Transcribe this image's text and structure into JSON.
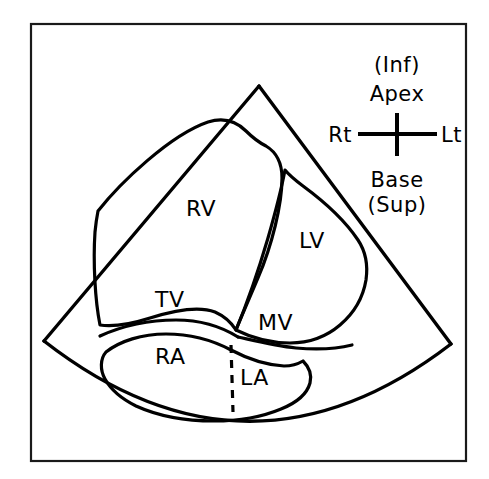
{
  "figure": {
    "background_color": "#ffffff",
    "line_color": "#000000",
    "frame_color": "#1a1a1a"
  },
  "chamber_labels": [
    {
      "id": "rv",
      "text": "RV",
      "x": 186,
      "y": 216,
      "name": "right-ventricle-label"
    },
    {
      "id": "lv",
      "text": "LV",
      "x": 299,
      "y": 248,
      "name": "left-ventricle-label"
    },
    {
      "id": "ra",
      "text": "RA",
      "x": 155,
      "y": 364,
      "name": "right-atrium-label"
    },
    {
      "id": "la",
      "text": "LA",
      "x": 240,
      "y": 385,
      "name": "left-atrium-label"
    }
  ],
  "valve_labels": [
    {
      "id": "tv",
      "text": "TV",
      "x": 155,
      "y": 307,
      "name": "tricuspid-valve-label"
    },
    {
      "id": "mv",
      "text": "MV",
      "x": 258,
      "y": 330,
      "name": "mitral-valve-label"
    }
  ],
  "compass": {
    "name": "orientation-compass",
    "top_paren": "(Inf)",
    "top_main": "Apex",
    "bottom_main": "Base",
    "bottom_paren": "(Sup)",
    "left": "Rt",
    "right": "Lt",
    "center_x": 397,
    "center_y": 134,
    "arm_horizontal": 40,
    "arm_vertical": 21
  }
}
